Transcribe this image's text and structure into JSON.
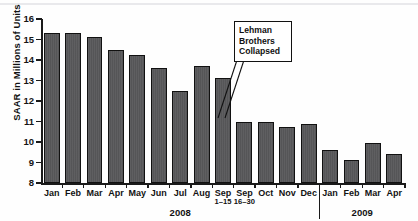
{
  "chart_data": {
    "type": "bar",
    "title": "",
    "xlabel": "",
    "ylabel": "SAAR in Millions of Units",
    "ylim": [
      8,
      16
    ],
    "ytick_values": [
      16,
      15,
      14,
      13,
      12,
      11,
      10,
      9,
      8
    ],
    "grid": false,
    "legend": null,
    "categories": [
      "Jan",
      "Feb",
      "Mar",
      "Apr",
      "May",
      "Jun",
      "Jul",
      "Aug",
      "Sep 1–15",
      "Sep 16–30",
      "Oct",
      "Nov",
      "Dec",
      "Jan",
      "Feb",
      "Mar",
      "Apr"
    ],
    "category_labels": [
      {
        "label": "Jan",
        "sub": ""
      },
      {
        "label": "Feb",
        "sub": ""
      },
      {
        "label": "Mar",
        "sub": ""
      },
      {
        "label": "Apr",
        "sub": ""
      },
      {
        "label": "May",
        "sub": ""
      },
      {
        "label": "Jun",
        "sub": ""
      },
      {
        "label": "Jul",
        "sub": ""
      },
      {
        "label": "Aug",
        "sub": ""
      },
      {
        "label": "Sep",
        "sub": "1–15"
      },
      {
        "label": "Sep",
        "sub": "16–30"
      },
      {
        "label": "Oct",
        "sub": ""
      },
      {
        "label": "Nov",
        "sub": ""
      },
      {
        "label": "Dec",
        "sub": ""
      },
      {
        "label": "Jan",
        "sub": ""
      },
      {
        "label": "Feb",
        "sub": ""
      },
      {
        "label": "Mar",
        "sub": ""
      },
      {
        "label": "Apr",
        "sub": ""
      }
    ],
    "values": [
      15.3,
      15.3,
      15.1,
      14.5,
      14.25,
      13.6,
      12.5,
      13.7,
      13.1,
      11.0,
      11.0,
      10.75,
      10.9,
      9.6,
      9.1,
      9.95,
      9.4
    ],
    "groups": [
      {
        "name": "2008",
        "start_index": 0,
        "end_index": 12
      },
      {
        "name": "2009",
        "start_index": 13,
        "end_index": 16
      }
    ],
    "annotations": [
      {
        "name": "lehman-brothers-collapsed",
        "lines": [
          "Lehman",
          "Brothers",
          "Collapsed"
        ],
        "points_to_category": "Sep 16–30"
      }
    ],
    "colors": {
      "bar_fill": "#58585a",
      "bar_stroke": "#111111",
      "axis": "#1a1a1a",
      "text": "#121212",
      "background": "#ffffff"
    }
  }
}
